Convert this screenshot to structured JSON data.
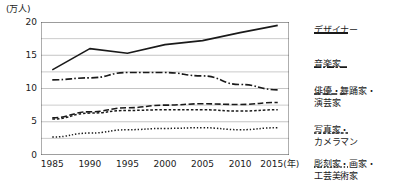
{
  "chart_data": {
    "type": "line",
    "title": "",
    "unit_label": "(万人)",
    "xlabel": "(年)",
    "ylabel": "",
    "x": [
      1985,
      1990,
      1995,
      2000,
      2005,
      2010,
      2015
    ],
    "xlim": [
      1983.5,
      2016.5
    ],
    "ylim": [
      0,
      20
    ],
    "yticks": [
      0,
      5,
      10,
      15,
      20
    ],
    "xticks": [
      "1985",
      "1990",
      "1995",
      "2000",
      "2005",
      "2010",
      "2015"
    ],
    "xaxis_suffix": "(年)",
    "grid": true,
    "gridlines_minor": true,
    "legend_position": "right",
    "series": [
      {
        "name": "デザイナー",
        "style": "solid",
        "values": [
          12.8,
          16.0,
          15.3,
          16.6,
          17.2,
          18.4,
          19.5
        ]
      },
      {
        "name": "音楽家",
        "style": "dash-dot",
        "values": [
          11.3,
          11.6,
          12.4,
          12.4,
          11.9,
          10.6,
          9.8
        ]
      },
      {
        "name": "俳優・舞踊家・\n演芸家",
        "style": "long-dash",
        "values": [
          5.6,
          6.5,
          7.1,
          7.5,
          7.7,
          7.6,
          7.9
        ]
      },
      {
        "name": "写真家・\nカメラマン",
        "style": "short-dash",
        "values": [
          5.4,
          6.3,
          6.7,
          6.8,
          6.8,
          6.6,
          6.8
        ]
      },
      {
        "name": "彫刻家・画家・\n工芸美術家",
        "style": "dotted",
        "values": [
          2.7,
          3.3,
          3.8,
          4.0,
          4.1,
          3.8,
          4.1
        ]
      }
    ]
  },
  "axis": {
    "yticks": [
      "20",
      "15",
      "10",
      "5",
      "0"
    ],
    "xticks": [
      "1985",
      "1990",
      "1995",
      "2000",
      "2005",
      "2010",
      "2015"
    ],
    "year_suffix": "(年)"
  },
  "colors": {
    "line": "#1a1a1a",
    "grid": "#b5b5b5",
    "axis": "#4a4a4a",
    "text": "#1a1a1a"
  }
}
